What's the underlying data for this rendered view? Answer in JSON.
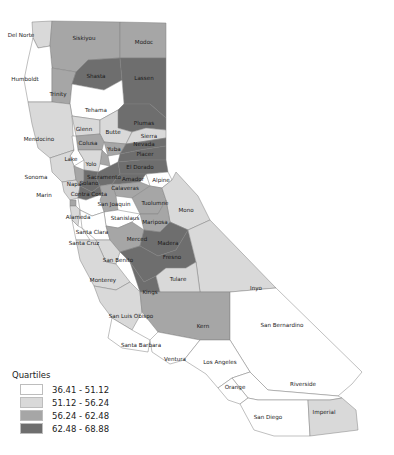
{
  "map": {
    "title": "California counties by quartile",
    "colors": {
      "q1": "#ffffff",
      "q2": "#d9d9d9",
      "q3": "#a6a6a6",
      "q4": "#6e6e6e"
    },
    "counties": [
      {
        "name": "Del Norte",
        "class": "q2"
      },
      {
        "name": "Siskiyou",
        "class": "q3"
      },
      {
        "name": "Modoc",
        "class": "q3"
      },
      {
        "name": "Humboldt",
        "class": "q1"
      },
      {
        "name": "Trinity",
        "class": "q3"
      },
      {
        "name": "Shasta",
        "class": "q4"
      },
      {
        "name": "Lassen",
        "class": "q4"
      },
      {
        "name": "Tehama",
        "class": "q1"
      },
      {
        "name": "Plumas",
        "class": "q4"
      },
      {
        "name": "Mendocino",
        "class": "q2"
      },
      {
        "name": "Glenn",
        "class": "q2"
      },
      {
        "name": "Butte",
        "class": "q2"
      },
      {
        "name": "Sierra",
        "class": "q2"
      },
      {
        "name": "Colusa",
        "class": "q3"
      },
      {
        "name": "Lake",
        "class": "q1"
      },
      {
        "name": "Yuba",
        "class": "q3"
      },
      {
        "name": "Nevada",
        "class": "q4"
      },
      {
        "name": "Placer",
        "class": "q4"
      },
      {
        "name": "Sutter",
        "class": "q3"
      },
      {
        "name": "Yolo",
        "class": "q2"
      },
      {
        "name": "El Dorado",
        "class": "q4"
      },
      {
        "name": "Sonoma",
        "class": "q2"
      },
      {
        "name": "Napa",
        "class": "q3"
      },
      {
        "name": "Sacramento",
        "class": "q4"
      },
      {
        "name": "Amador",
        "class": "q4"
      },
      {
        "name": "Alpine",
        "class": "q1"
      },
      {
        "name": "Solano",
        "class": "q4"
      },
      {
        "name": "Marin",
        "class": "q2"
      },
      {
        "name": "Calaveras",
        "class": "q3"
      },
      {
        "name": "Contra Costa",
        "class": "q4"
      },
      {
        "name": "San Joaquin",
        "class": "q3"
      },
      {
        "name": "Tuolumne",
        "class": "q3"
      },
      {
        "name": "Mono",
        "class": "q2"
      },
      {
        "name": "San Francisco",
        "class": "q3"
      },
      {
        "name": "Alameda",
        "class": "q1"
      },
      {
        "name": "San Mateo",
        "class": "q2"
      },
      {
        "name": "Stanislaus",
        "class": "q1"
      },
      {
        "name": "Mariposa",
        "class": "q3"
      },
      {
        "name": "Santa Clara",
        "class": "q1"
      },
      {
        "name": "Santa Cruz",
        "class": "q1"
      },
      {
        "name": "Merced",
        "class": "q3"
      },
      {
        "name": "Madera",
        "class": "q4"
      },
      {
        "name": "San Benito",
        "class": "q2"
      },
      {
        "name": "Fresno",
        "class": "q4"
      },
      {
        "name": "Inyo",
        "class": "q2"
      },
      {
        "name": "Monterey",
        "class": "q2"
      },
      {
        "name": "Kings",
        "class": "q4"
      },
      {
        "name": "Tulare",
        "class": "q2"
      },
      {
        "name": "San Luis Obispo",
        "class": "q2"
      },
      {
        "name": "Kern",
        "class": "q3"
      },
      {
        "name": "San Bernardino",
        "class": "q1"
      },
      {
        "name": "Santa Barbara",
        "class": "q1"
      },
      {
        "name": "Ventura",
        "class": "q1"
      },
      {
        "name": "Los Angeles",
        "class": "q1"
      },
      {
        "name": "Riverside",
        "class": "q1"
      },
      {
        "name": "Orange",
        "class": "q1"
      },
      {
        "name": "San Diego",
        "class": "q1"
      },
      {
        "name": "Imperial",
        "class": "q2"
      }
    ]
  },
  "legend": {
    "title": "Quartiles",
    "items": [
      {
        "label": "36.41 - 51.12",
        "class": "q1"
      },
      {
        "label": "51.12 - 56.24",
        "class": "q2"
      },
      {
        "label": "56.24 - 62.48",
        "class": "q3"
      },
      {
        "label": "62.48 - 68.88",
        "class": "q4"
      }
    ]
  }
}
